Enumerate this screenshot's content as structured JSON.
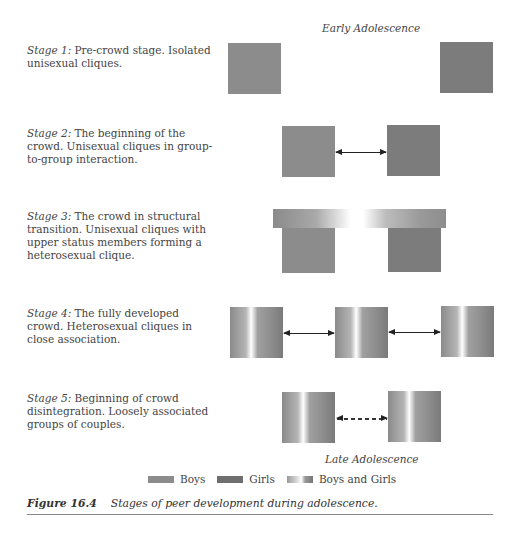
{
  "figure": {
    "label": "Figure 16.4",
    "caption": "Stages of peer development during adolescence.",
    "top_label": "Early Adolescence",
    "bottom_label": "Late Adolescence"
  },
  "stages": [
    {
      "title": "Stage 1:",
      "text": "Pre-crowd stage. Isolated unisexual cliques."
    },
    {
      "title": "Stage 2:",
      "text": "The beginning of the crowd. Unisexual cliques in group-to-group interaction."
    },
    {
      "title": "Stage 3:",
      "text": "The crowd in structural transition.  Unisexual cliques with upper status members forming a heterosexual clique."
    },
    {
      "title": "Stage 4:",
      "text": "The fully developed crowd. Heterosexual cliques in close association."
    },
    {
      "title": "Stage 5:",
      "text": "Beginning of crowd disintegration.  Loosely associated groups of couples."
    }
  ],
  "legend": [
    {
      "label": "Boys",
      "color": "#8c8c8c"
    },
    {
      "label": "Girls",
      "color": "#6e6e6e"
    },
    {
      "label": "Boys and Girls",
      "color": "gradient"
    }
  ]
}
